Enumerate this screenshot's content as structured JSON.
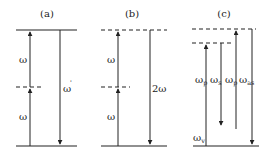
{
  "figure": {
    "panels": [
      {
        "id": "a",
        "title": "(a)",
        "labels": {
          "up_lower": "ω",
          "up_upper": "ω",
          "down": "ω",
          "down_prime": "'"
        }
      },
      {
        "id": "b",
        "title": "(b)",
        "labels": {
          "up_lower": "ω",
          "up_upper": "ω",
          "down": "2ω"
        }
      },
      {
        "id": "c",
        "title": "(c)",
        "labels": {
          "pump1": "ω",
          "pump1_sub": "p",
          "stokes": "ω",
          "stokes_sub": "s",
          "pump2": "ω",
          "pump2_sub": "p",
          "antistokes": "ω",
          "antistokes_sub": "as",
          "vib": "ω",
          "vib_sub": "v"
        }
      }
    ],
    "colors": {
      "line": "#222222",
      "background": "#ffffff"
    }
  }
}
